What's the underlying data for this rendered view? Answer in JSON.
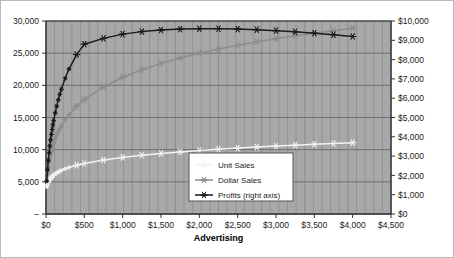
{
  "chart_data": {
    "type": "line",
    "title": "",
    "subtitle": "",
    "xlabel": "Advertising",
    "ylabel": "",
    "y2label": "",
    "grid": true,
    "legend_position": "inside-bottom-center",
    "xlim": [
      0,
      4500
    ],
    "ylim": [
      0,
      30000
    ],
    "y2lim": [
      0,
      10000
    ],
    "x_ticks": [
      "$0",
      "$500",
      "$1,000",
      "$1,500",
      "$2,000",
      "$2,500",
      "$3,000",
      "$3,500",
      "$4,000",
      "$4,500"
    ],
    "x_tick_values": [
      0,
      500,
      1000,
      1500,
      2000,
      2500,
      3000,
      3500,
      4000,
      4500
    ],
    "y_ticks": [
      "–",
      "5,000",
      "10,000",
      "15,000",
      "20,000",
      "25,000",
      "30,000"
    ],
    "y_tick_values": [
      0,
      5000,
      10000,
      15000,
      20000,
      25000,
      30000
    ],
    "y2_ticks": [
      "$0",
      "$1,000",
      "$2,000",
      "$3,000",
      "$4,000",
      "$5,000",
      "$6,000",
      "$7,000",
      "$8,000",
      "$9,000",
      "$10,000"
    ],
    "y2_tick_values": [
      0,
      1000,
      2000,
      3000,
      4000,
      5000,
      6000,
      7000,
      8000,
      9000,
      10000
    ],
    "series": [
      {
        "name": "Unit Sales",
        "axis": "left",
        "color": "#f2f2f2",
        "marker": "asterisk",
        "x": [
          10,
          20,
          30,
          40,
          50,
          60,
          70,
          80,
          90,
          100,
          120,
          140,
          160,
          180,
          200,
          250,
          300,
          400,
          500,
          750,
          1000,
          1250,
          1500,
          1750,
          2000,
          2250,
          2500,
          2750,
          3000,
          3250,
          3500,
          3750,
          4000
        ],
        "values": [
          4200,
          4600,
          4900,
          5150,
          5350,
          5520,
          5670,
          5800,
          5920,
          6030,
          6220,
          6390,
          6530,
          6660,
          6780,
          7030,
          7240,
          7580,
          7850,
          8390,
          8800,
          9130,
          9410,
          9650,
          9870,
          10060,
          10240,
          10400,
          10560,
          10700,
          10840,
          10960,
          11080
        ]
      },
      {
        "name": "Dollar Sales",
        "axis": "left",
        "color": "#8c8c8c",
        "marker": "asterisk",
        "x": [
          10,
          20,
          30,
          40,
          50,
          60,
          70,
          80,
          90,
          100,
          120,
          140,
          160,
          180,
          200,
          250,
          300,
          400,
          500,
          750,
          1000,
          1250,
          1500,
          1750,
          2000,
          2250,
          2500,
          2750,
          3000,
          3250,
          3500,
          3750,
          4000
        ],
        "values": [
          5200,
          6400,
          7300,
          8050,
          8700,
          9250,
          9760,
          10200,
          10620,
          11000,
          11680,
          12280,
          12810,
          13290,
          13730,
          14670,
          15460,
          16750,
          17790,
          19770,
          21250,
          22430,
          23410,
          24250,
          24990,
          25640,
          26230,
          26760,
          27250,
          27700,
          28110,
          28500,
          28870
        ]
      },
      {
        "name": "Profits (right axis)",
        "axis": "right",
        "color": "#1a1a1a",
        "marker": "asterisk",
        "x": [
          10,
          20,
          30,
          40,
          50,
          60,
          70,
          80,
          90,
          100,
          120,
          140,
          160,
          180,
          200,
          250,
          300,
          400,
          500,
          750,
          1000,
          1250,
          1500,
          1750,
          2000,
          2250,
          2500,
          2750,
          3000,
          3250,
          3500,
          3750,
          4000
        ],
        "values": [
          1700,
          2300,
          2780,
          3180,
          3530,
          3840,
          4120,
          4380,
          4620,
          4840,
          5240,
          5590,
          5910,
          6200,
          6460,
          7030,
          7510,
          8260,
          8800,
          9100,
          9320,
          9450,
          9530,
          9580,
          9600,
          9600,
          9580,
          9550,
          9500,
          9440,
          9370,
          9290,
          9200
        ]
      }
    ],
    "legend_entries": [
      "Unit Sales",
      "Dollar Sales",
      "Profits (right axis)"
    ],
    "colors": {
      "plot_background": "#a8a8a8",
      "gridline": "#707070",
      "minor_gridline": "#8f8f8f",
      "axis": "#333333",
      "legend_background": "#ffffff",
      "legend_border": "#555555",
      "page_background": "#ffffff"
    }
  }
}
